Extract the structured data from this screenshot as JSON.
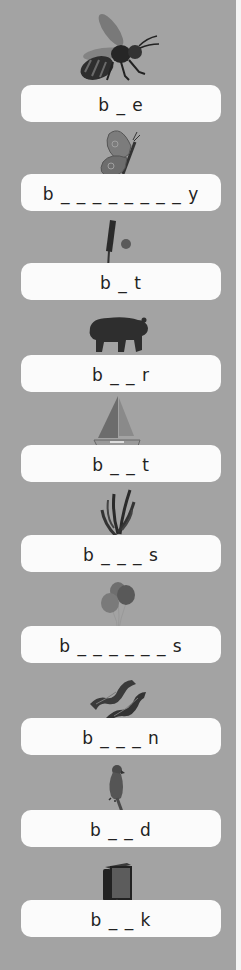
{
  "worksheet": {
    "theme": "Words beginning with b",
    "items": [
      {
        "picture": "bee-icon",
        "prompt": "b _ e",
        "box_top": 85
      },
      {
        "picture": "butterfly-icon",
        "prompt": "b _ _ _ _ _ _ _ _ y",
        "box_top": 174
      },
      {
        "picture": "bat-and-ball-icon",
        "prompt": "b _ t",
        "box_top": 263
      },
      {
        "picture": "bear-icon",
        "prompt": "b _ _ r",
        "box_top": 355
      },
      {
        "picture": "boat-icon",
        "prompt": "b _ _ t",
        "box_top": 445
      },
      {
        "picture": "bugs-grass-icon",
        "prompt": "b _ _ _ s",
        "box_top": 535
      },
      {
        "picture": "balloons-icon",
        "prompt": "b _ _ _ _ _ _ s",
        "box_top": 626
      },
      {
        "picture": "bacon-icon",
        "prompt": "b _ _ _ n",
        "box_top": 718
      },
      {
        "picture": "bird-icon",
        "prompt": "b _ _ d",
        "box_top": 810
      },
      {
        "picture": "book-icon",
        "prompt": "b _ _ k",
        "box_top": 900
      }
    ]
  },
  "colors": {
    "background": "#a3a3a3",
    "box": "#fbfbfb",
    "text": "#222222",
    "edge": "#f4f4f4"
  }
}
